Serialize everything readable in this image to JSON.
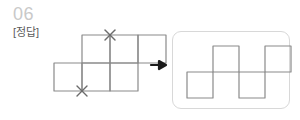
{
  "header": {
    "problem_number": "06",
    "answer_label": "[정답]",
    "number_color": "#c9c9c9",
    "label_color": "#5a5a5a"
  },
  "colors": {
    "square_stroke": "#8a8a8a",
    "result_stroke": "#8a8a8a",
    "x_mark": "#6b6b6b",
    "arrow": "#1a1a1a",
    "panel_border": "#d8d8d8",
    "background": "#ffffff"
  },
  "arrow": {
    "icon": "arrow-right-icon",
    "direction": "right",
    "glyph": "→"
  },
  "source_figure": {
    "name": "net-of-cube-with-cut-marks",
    "cell_size": 28,
    "grid_cols": 4,
    "grid_rows": 2,
    "cells": [
      {
        "col": 1,
        "row": 0
      },
      {
        "col": 2,
        "row": 0
      },
      {
        "col": 3,
        "row": 0
      },
      {
        "col": 0,
        "row": 1
      },
      {
        "col": 1,
        "row": 1
      },
      {
        "col": 2,
        "row": 1
      }
    ],
    "x_marks": [
      {
        "col": 2,
        "row": 0,
        "edge": "left",
        "label": "cut-mark-top"
      },
      {
        "col": 1,
        "row": 1,
        "edge": "left",
        "label": "cut-mark-bottom"
      }
    ]
  },
  "result_figure": {
    "name": "folded-zigzag-outline",
    "cell_size": 26,
    "grid_cols": 4,
    "grid_rows": 2,
    "cells": [
      {
        "col": 1,
        "row": 0
      },
      {
        "col": 3,
        "row": 0
      },
      {
        "col": 0,
        "row": 1
      },
      {
        "col": 2,
        "row": 1
      }
    ],
    "connectors": [
      {
        "from": {
          "col": 1,
          "row": 0
        },
        "to": {
          "col": 0,
          "row": 1
        }
      },
      {
        "from": {
          "col": 1,
          "row": 0
        },
        "to": {
          "col": 2,
          "row": 1
        }
      },
      {
        "from": {
          "col": 3,
          "row": 0
        },
        "to": {
          "col": 2,
          "row": 1
        }
      }
    ]
  }
}
